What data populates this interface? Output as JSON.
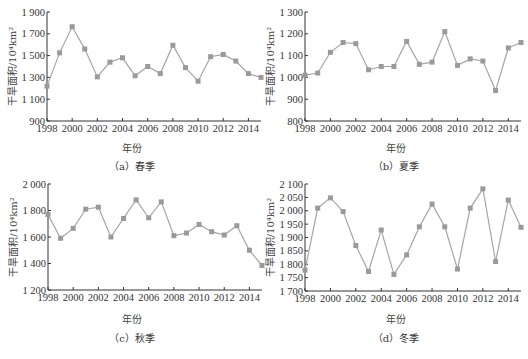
{
  "chart_data": [
    {
      "id": "a",
      "type": "line",
      "caption": "（a）春季",
      "title": "",
      "xlabel": "年份",
      "ylabel": "干旱面积/10⁴km²",
      "x": [
        1998,
        1999,
        2000,
        2001,
        2002,
        2003,
        2004,
        2005,
        2006,
        2007,
        2008,
        2009,
        2010,
        2011,
        2012,
        2013,
        2014,
        2015
      ],
      "xticks": [
        1998,
        2000,
        2002,
        2004,
        2006,
        2008,
        2010,
        2012,
        2014
      ],
      "yticks": [
        900,
        1100,
        1300,
        1500,
        1700,
        1900
      ],
      "ytick_labels": [
        "900",
        "1 100",
        "1 300",
        "1 500",
        "1 700",
        "1 900"
      ],
      "ylim": [
        900,
        1900
      ],
      "series": [
        {
          "name": "春季",
          "values": [
            1220,
            1525,
            1765,
            1560,
            1305,
            1440,
            1480,
            1315,
            1400,
            1335,
            1595,
            1390,
            1265,
            1490,
            1510,
            1450,
            1335,
            1300
          ]
        }
      ],
      "grid": false,
      "legend": "none"
    },
    {
      "id": "b",
      "type": "line",
      "caption": "（b）夏季",
      "title": "",
      "xlabel": "年份",
      "ylabel": "干旱面积/10⁴km²",
      "x": [
        1998,
        1999,
        2000,
        2001,
        2002,
        2003,
        2004,
        2005,
        2006,
        2007,
        2008,
        2009,
        2010,
        2011,
        2012,
        2013,
        2014,
        2015
      ],
      "xticks": [
        1998,
        2000,
        2002,
        2004,
        2006,
        2008,
        2010,
        2012,
        2014
      ],
      "yticks": [
        800,
        900,
        1000,
        1100,
        1200,
        1300
      ],
      "ytick_labels": [
        "800",
        "900",
        "1 000",
        "1 100",
        "1 200",
        "1 300"
      ],
      "ylim": [
        800,
        1300
      ],
      "series": [
        {
          "name": "夏季",
          "values": [
            1010,
            1020,
            1115,
            1160,
            1155,
            1035,
            1050,
            1050,
            1165,
            1060,
            1070,
            1210,
            1055,
            1085,
            1075,
            940,
            1135,
            1160
          ]
        }
      ],
      "grid": false,
      "legend": "none"
    },
    {
      "id": "c",
      "type": "line",
      "caption": "（c）秋季",
      "title": "",
      "xlabel": "年份",
      "ylabel": "干旱面积/10⁴km²",
      "x": [
        1998,
        1999,
        2000,
        2001,
        2002,
        2003,
        2004,
        2005,
        2006,
        2007,
        2008,
        2009,
        2010,
        2011,
        2012,
        2013,
        2014,
        2015
      ],
      "xticks": [
        1998,
        2000,
        2002,
        2004,
        2006,
        2008,
        2010,
        2012,
        2014
      ],
      "yticks": [
        1200,
        1400,
        1600,
        1800,
        2000
      ],
      "ytick_labels": [
        "1 200",
        "1 400",
        "1 600",
        "1 800",
        "2 000"
      ],
      "ylim": [
        1200,
        2000
      ],
      "series": [
        {
          "name": "秋季",
          "values": [
            1770,
            1590,
            1665,
            1810,
            1825,
            1600,
            1740,
            1880,
            1745,
            1865,
            1610,
            1630,
            1695,
            1640,
            1615,
            1685,
            1500,
            1385
          ]
        }
      ],
      "grid": false,
      "legend": "none"
    },
    {
      "id": "d",
      "type": "line",
      "caption": "（d）冬季",
      "title": "",
      "xlabel": "年份",
      "ylabel": "干旱面积/10⁴km²",
      "x": [
        1998,
        1999,
        2000,
        2001,
        2002,
        2003,
        2004,
        2005,
        2006,
        2007,
        2008,
        2009,
        2010,
        2011,
        2012,
        2013,
        2014,
        2015
      ],
      "xticks": [
        1998,
        2000,
        2002,
        2004,
        2006,
        2008,
        2010,
        2012,
        2014
      ],
      "yticks": [
        1700,
        1750,
        1800,
        1850,
        1900,
        1950,
        2000,
        2050,
        2100
      ],
      "ytick_labels": [
        "1 700",
        "1 750",
        "1 800",
        "1 850",
        "1 900",
        "1 950",
        "2 000",
        "2 050",
        "2 100"
      ],
      "ylim": [
        1700,
        2100
      ],
      "series": [
        {
          "name": "冬季",
          "values": [
            1778,
            2010,
            2048,
            1997,
            1870,
            1773,
            1928,
            1762,
            1835,
            1940,
            2025,
            1940,
            1782,
            2010,
            2082,
            1810,
            2040,
            1938
          ]
        }
      ],
      "grid": false,
      "legend": "none"
    }
  ],
  "style": {
    "line_color": "#a6a6a6",
    "marker_color": "#9a9a9a",
    "axis_color": "#333333"
  },
  "panels": [
    {
      "caption": "（a）春季",
      "xlabel": "年份"
    },
    {
      "caption": "（b）夏季",
      "xlabel": "年份"
    },
    {
      "caption": "（c）秋季",
      "xlabel": "年份"
    },
    {
      "caption": "（d）冬季",
      "xlabel": "年份"
    }
  ]
}
